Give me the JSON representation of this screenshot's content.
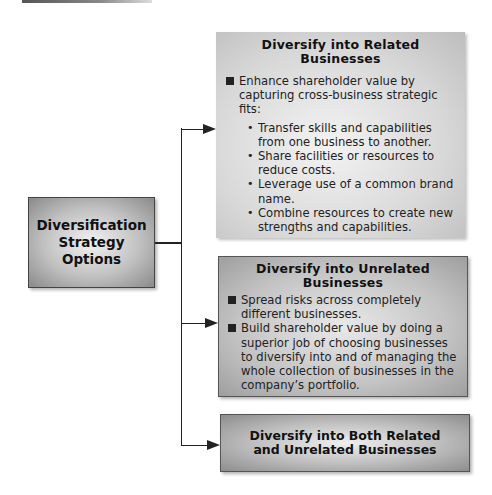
{
  "root": {
    "title_lines": [
      "Diversification",
      "Strategy",
      "Options"
    ]
  },
  "options": [
    {
      "title_lines": [
        "Diversify into Related",
        "Businesses"
      ],
      "bullets": [
        {
          "text": "Enhance shareholder value by capturing cross-business strategic fits:",
          "subbullets": [
            "Transfer skills and capabilities from one business to another.",
            "Share facilities or resources to reduce costs.",
            "Leverage use of a common brand name.",
            "Combine resources to create new strengths and capabilities."
          ]
        }
      ]
    },
    {
      "title_lines": [
        "Diversify into Unrelated",
        "Businesses"
      ],
      "bullets": [
        {
          "text": "Spread risks across completely different businesses."
        },
        {
          "text": "Build shareholder value by doing a superior job of choosing businesses to diversify into and of managing the whole collection of businesses in the company’s portfolio."
        }
      ]
    },
    {
      "title_lines": [
        "Diversify into Both Related",
        "and Unrelated Businesses"
      ]
    }
  ],
  "colors": {
    "connector": "#222222",
    "box_border": "#555555",
    "text": "#111111"
  }
}
